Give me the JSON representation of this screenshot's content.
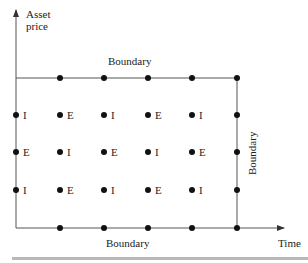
{
  "diagram": {
    "y_axis_label_line1": "Asset",
    "y_axis_label_line2": "price",
    "x_axis_label": "Time",
    "top_boundary_label": "Boundary",
    "bottom_boundary_label": "Boundary",
    "right_boundary_label": "Boundary",
    "grid": {
      "columns_x": [
        16,
        60,
        104,
        148,
        192,
        237
      ],
      "rows_y": [
        78,
        115,
        152,
        190,
        228
      ],
      "interior_rows": [
        [
          "I",
          "E",
          "I",
          "E",
          "I"
        ],
        [
          "E",
          "I",
          "E",
          "I",
          "E"
        ],
        [
          "I",
          "E",
          "I",
          "E",
          "I"
        ]
      ]
    },
    "colors": {
      "line": "#555555",
      "dot": "#111111",
      "text": "#222222",
      "bar": "#b8b8b8"
    }
  }
}
